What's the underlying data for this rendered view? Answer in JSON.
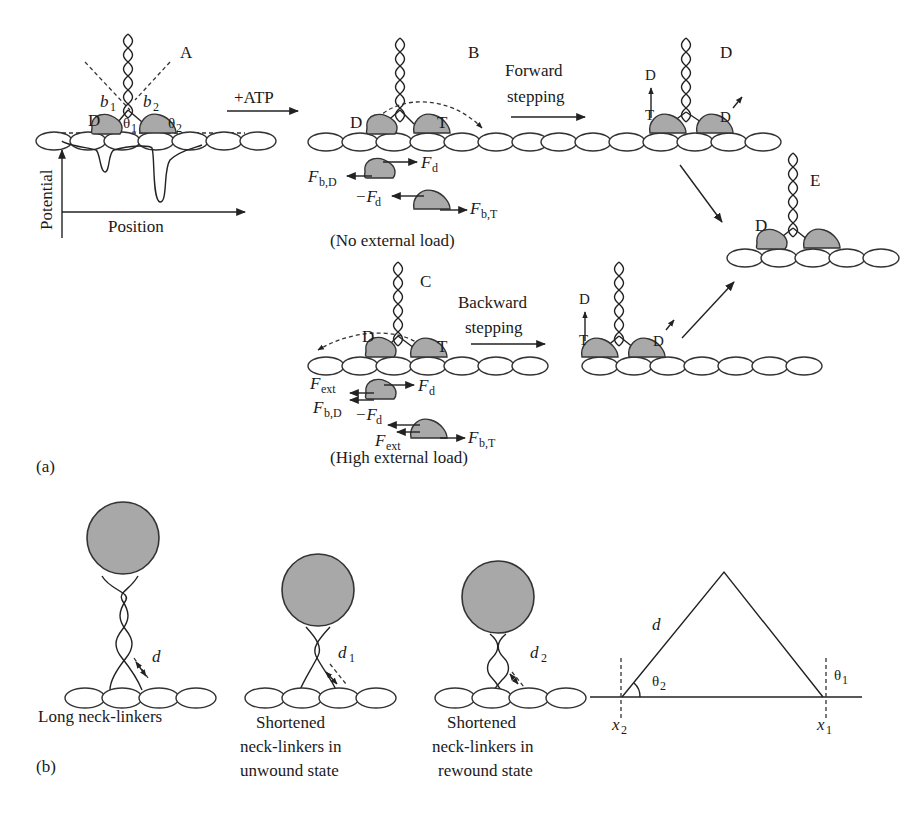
{
  "figure": {
    "panel_a": {
      "label": "(a)",
      "state_A": {
        "label": "A",
        "head_left": "D",
        "b1": "b",
        "b1_sub": "1",
        "b2": "b",
        "b2_sub": "2",
        "theta1": "θ",
        "theta1_sub": "1",
        "theta2": "θ",
        "theta2_sub": "2",
        "y_axis": "Potential",
        "x_axis": "Position"
      },
      "arrow_atp": "+ATP",
      "state_B": {
        "label": "B",
        "head_left": "D",
        "head_right": "T",
        "force_d": "F",
        "force_d_sub": "d",
        "force_bD": "F",
        "force_bD_sub": "b,D",
        "force_neg_d": "−F",
        "force_neg_d_sub": "d",
        "force_bT": "F",
        "force_bT_sub": "b,T",
        "caption": "(No external load)"
      },
      "arrow_forward": {
        "line1": "Forward",
        "line2": "stepping"
      },
      "state_D": {
        "label": "D",
        "release_from": "T",
        "release_to": "D",
        "head_right": "D"
      },
      "state_E": {
        "label": "E",
        "head_left": "D"
      },
      "state_C": {
        "label": "C",
        "head_left": "D",
        "head_right": "T",
        "force_ext": "F",
        "force_ext_sub": "ext",
        "force_d": "F",
        "force_d_sub": "d",
        "force_bD": "F",
        "force_bD_sub": "b,D",
        "force_neg_d": "−F",
        "force_neg_d_sub": "d",
        "force_ext2": "F",
        "force_ext2_sub": "ext",
        "force_bT": "F",
        "force_bT_sub": "b,T",
        "caption": "(High external load)"
      },
      "arrow_backward": {
        "line1": "Backward",
        "line2": "stepping"
      },
      "state_backward_result": {
        "release_from": "T",
        "release_to": "D",
        "head_right": "D"
      }
    },
    "panel_b": {
      "label": "(b)",
      "long": {
        "distance": "d",
        "caption": "Long neck-linkers"
      },
      "unwound": {
        "distance": "d",
        "distance_sub": "1",
        "caption_lines": [
          "Shortened",
          "neck-linkers in",
          "unwound state"
        ]
      },
      "rewound": {
        "distance": "d",
        "distance_sub": "2",
        "caption_lines": [
          "Shortened",
          "neck-linkers in",
          "rewound state"
        ]
      },
      "geometry": {
        "side": "d",
        "theta2": "θ",
        "theta2_sub": "2",
        "theta1": "θ",
        "theta1_sub": "1",
        "x2": "x",
        "x2_sub": "2",
        "x1": "x",
        "x1_sub": "1"
      }
    }
  }
}
